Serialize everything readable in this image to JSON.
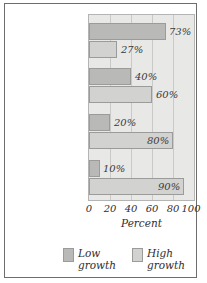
{
  "chart_data": {
    "type": "bar",
    "orientation": "horizontal",
    "title": "",
    "xlabel": "Percent",
    "ylabel": "",
    "xlim": [
      0,
      100
    ],
    "xticks": [
      "0",
      "20",
      "40",
      "60",
      "80",
      "100"
    ],
    "grid": true,
    "legend_position": "bottom",
    "categories": [
      "All start-ups",
      "New-company jobs",
      "New-company sales",
      "New-company exports"
    ],
    "category_lines": [
      [
        "All",
        "start-ups"
      ],
      [
        "New-company",
        "jobs"
      ],
      [
        "New-company",
        "sales"
      ],
      [
        "New-company",
        "exports"
      ]
    ],
    "series": [
      {
        "name": "Low growth",
        "color": "#b9b9b7",
        "values": [
          73,
          40,
          20,
          10
        ],
        "labels": [
          "73%",
          "40%",
          "20%",
          "10%"
        ]
      },
      {
        "name": "High growth",
        "color": "#d2d2d0",
        "values": [
          27,
          60,
          80,
          90
        ],
        "labels": [
          "27%",
          "60%",
          "80%",
          "90%"
        ]
      }
    ]
  },
  "legend": {
    "items": [
      {
        "line1": "Low",
        "line2": "growth"
      },
      {
        "line1": "High",
        "line2": "growth"
      }
    ]
  },
  "axis": {
    "x_title": "Percent",
    "ticks": [
      "0",
      "20",
      "40",
      "60",
      "80",
      "100"
    ]
  }
}
